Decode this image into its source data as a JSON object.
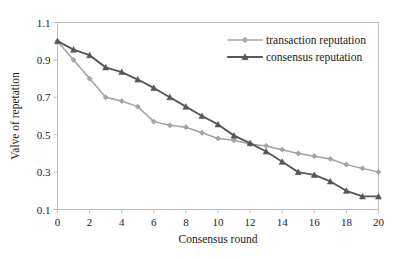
{
  "chart_data": {
    "type": "line",
    "title": "",
    "xlabel": "Consensus round",
    "ylabel": "Valve of repetation",
    "xlim": [
      0,
      20
    ],
    "ylim": [
      0.1,
      1.1
    ],
    "xticks": [
      "0",
      "2",
      "4",
      "6",
      "8",
      "10",
      "12",
      "14",
      "16",
      "18",
      "20"
    ],
    "yticks": [
      "0.1",
      "0.3",
      "0.5",
      "0.7",
      "0.9",
      "1.1"
    ],
    "grid": false,
    "legend_position": "top-right",
    "x": [
      0,
      1,
      2,
      3,
      4,
      5,
      6,
      7,
      8,
      9,
      10,
      11,
      12,
      13,
      14,
      15,
      16,
      17,
      18,
      19,
      20
    ],
    "series": [
      {
        "name": "transaction reputation",
        "color": "#a3a3a3",
        "marker": "diamond",
        "values": [
          1.0,
          0.9,
          0.8,
          0.7,
          0.68,
          0.65,
          0.57,
          0.55,
          0.54,
          0.51,
          0.48,
          0.47,
          0.45,
          0.44,
          0.42,
          0.4,
          0.385,
          0.37,
          0.34,
          0.32,
          0.3
        ]
      },
      {
        "name": "consensus reputation",
        "color": "#575757",
        "marker": "triangle",
        "values": [
          1.0,
          0.955,
          0.925,
          0.86,
          0.835,
          0.795,
          0.75,
          0.7,
          0.65,
          0.6,
          0.555,
          0.495,
          0.455,
          0.41,
          0.355,
          0.3,
          0.285,
          0.25,
          0.2,
          0.17,
          0.17
        ]
      }
    ]
  },
  "legend": {
    "entries": [
      {
        "label": "transaction reputation"
      },
      {
        "label": "consensus reputation"
      }
    ]
  },
  "axes": {
    "x_title": "Consensus round",
    "y_title": "Valve of repetation"
  },
  "colors": {
    "transaction": "#a3a3a3",
    "consensus": "#575757",
    "frame": "#bfbfbf",
    "text": "#1a1a1a",
    "background": "#ffffff"
  }
}
